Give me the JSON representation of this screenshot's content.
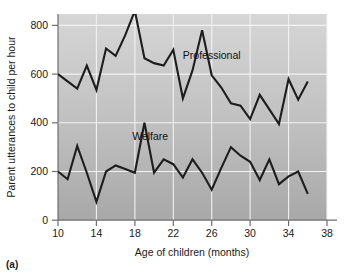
{
  "figure": {
    "panel_caption": "(a)",
    "background_color": "#ffffff",
    "plot_background_top": "#d5d5d5",
    "plot_background_bottom": "#a9a9a9",
    "gridline_color": "#f2f2f2",
    "line_color": "#1d1d1d",
    "axis_color": "#6e6e6e"
  },
  "chart_data": {
    "type": "line",
    "title": "",
    "subtitle": "",
    "xlabel": "Age of children (months)",
    "ylabel": "Parent utterances to child per hour",
    "xlim": [
      10,
      38
    ],
    "ylim": [
      0,
      880
    ],
    "xticks": [
      10,
      14,
      18,
      22,
      26,
      30,
      34,
      38
    ],
    "xtick_labels": [
      "10",
      "14",
      "18",
      "22",
      "26",
      "30",
      "34",
      "38"
    ],
    "yticks": [
      0,
      200,
      400,
      600,
      800
    ],
    "ytick_labels": [
      "0",
      "200",
      "400",
      "600",
      "800"
    ],
    "grid": true,
    "grid_axes": "both",
    "legend_position": "inline-annotation",
    "x": [
      10,
      11,
      12,
      13,
      14,
      15,
      16,
      17,
      18,
      19,
      20,
      21,
      22,
      23,
      24,
      25,
      26,
      27,
      28,
      29,
      30,
      31,
      32,
      33,
      34,
      35,
      36
    ],
    "series": [
      {
        "name": "Professional",
        "annotation_label": "Professional",
        "annotation_x": 26.0,
        "annotation_y": 680,
        "values": [
          600,
          570,
          540,
          635,
          535,
          705,
          675,
          760,
          860,
          665,
          645,
          635,
          700,
          500,
          615,
          780,
          595,
          545,
          480,
          470,
          415,
          515,
          455,
          395,
          580,
          495,
          570
        ]
      },
      {
        "name": "Welfare",
        "annotation_label": "Welfare",
        "annotation_x": 19.6,
        "annotation_y": 345,
        "values": [
          200,
          168,
          305,
          195,
          75,
          200,
          225,
          210,
          195,
          400,
          195,
          250,
          230,
          175,
          250,
          195,
          125,
          215,
          300,
          265,
          240,
          165,
          250,
          148,
          180,
          200,
          108
        ]
      }
    ]
  }
}
